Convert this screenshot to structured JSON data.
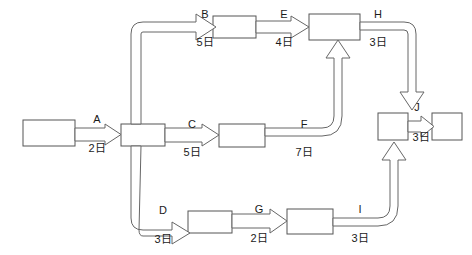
{
  "diagram": {
    "type": "activity-on-arrow-network",
    "background_color": "#ffffff",
    "line_color": "#666666",
    "text_color": "#1a1a1a",
    "nodes": [
      {
        "id": "n-start",
        "name": "start-node",
        "x": 23,
        "y": 120,
        "w": 52,
        "h": 26
      },
      {
        "id": "n-hub",
        "name": "hub-node",
        "x": 121,
        "y": 124,
        "w": 44,
        "h": 22
      },
      {
        "id": "n-b",
        "name": "activity-b-node",
        "x": 213,
        "y": 16,
        "w": 43,
        "h": 22
      },
      {
        "id": "n-h",
        "name": "activity-h-node",
        "x": 309,
        "y": 14,
        "w": 51,
        "h": 26
      },
      {
        "id": "n-c",
        "name": "activity-c-node",
        "x": 219,
        "y": 124,
        "w": 46,
        "h": 23
      },
      {
        "id": "n-j",
        "name": "activity-j-node",
        "x": 378,
        "y": 113,
        "w": 30,
        "h": 27
      },
      {
        "id": "n-end",
        "name": "end-node",
        "x": 432,
        "y": 113,
        "w": 30,
        "h": 27
      },
      {
        "id": "n-d",
        "name": "activity-d-node",
        "x": 188,
        "y": 211,
        "w": 44,
        "h": 22
      },
      {
        "id": "n-g",
        "name": "activity-g-node",
        "x": 287,
        "y": 209,
        "w": 46,
        "h": 25
      }
    ],
    "edges": [
      {
        "id": "e-a",
        "name": "edge-a",
        "label": "A",
        "duration": "2日",
        "label_x": 97,
        "label_y": 123,
        "dur_x": 97,
        "dur_y": 148
      },
      {
        "id": "e-b",
        "name": "edge-b",
        "label": "B",
        "duration": "5日",
        "label_x": 205,
        "label_y": 18,
        "dur_x": 205,
        "dur_y": 45
      },
      {
        "id": "e-c",
        "name": "edge-c",
        "label": "C",
        "duration": "5日",
        "label_x": 192,
        "label_y": 128,
        "dur_x": 192,
        "dur_y": 153
      },
      {
        "id": "e-d",
        "name": "edge-d",
        "label": "D",
        "duration": "3日",
        "label_x": 163,
        "label_y": 214,
        "dur_x": 163,
        "dur_y": 240
      },
      {
        "id": "e-e",
        "name": "edge-e",
        "label": "E",
        "duration": "4日",
        "label_x": 284,
        "label_y": 18,
        "dur_x": 284,
        "dur_y": 45
      },
      {
        "id": "e-f",
        "name": "edge-f",
        "label": "F",
        "duration": "7日",
        "label_x": 304,
        "label_y": 128,
        "dur_x": 304,
        "dur_y": 153
      },
      {
        "id": "e-g",
        "name": "edge-g",
        "label": "G",
        "duration": "2日",
        "label_x": 259,
        "label_y": 213,
        "dur_x": 259,
        "dur_y": 239
      },
      {
        "id": "e-h",
        "name": "edge-h",
        "label": "H",
        "duration": "3日",
        "label_x": 378,
        "label_y": 18,
        "dur_x": 378,
        "dur_y": 45
      },
      {
        "id": "e-i",
        "name": "edge-i",
        "label": "I",
        "duration": "3日",
        "label_x": 360,
        "label_y": 213,
        "dur_x": 360,
        "dur_y": 239
      },
      {
        "id": "e-j",
        "name": "edge-j",
        "label": "J",
        "duration": "3日",
        "label_x": 417,
        "label_y": 111,
        "dur_x": 420,
        "dur_y": 141
      }
    ]
  }
}
